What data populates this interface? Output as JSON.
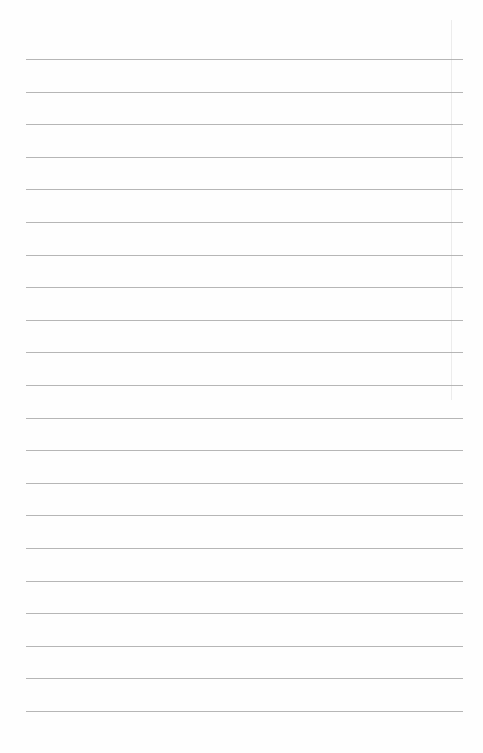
{
  "document": {
    "type": "lined-paper",
    "line_count": 21,
    "line_start_y": 59,
    "line_spacing": 32.6,
    "line_left_x": 26,
    "line_width": 437,
    "line_color": "#a9a9a9",
    "background_color": "#fefefe"
  }
}
